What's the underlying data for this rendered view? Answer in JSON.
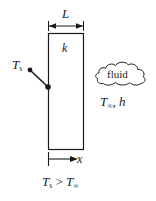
{
  "figure": {
    "ink_color": "#1a1a1a",
    "background_color": "#ffffff"
  },
  "wall": {
    "thickness_label": "L",
    "conductivity_label": "k",
    "surface_temp_symbol": "T",
    "surface_temp_subscript": "s"
  },
  "fluid": {
    "cloud_label": "fluid",
    "temp_symbol": "T",
    "temp_subscript": "∞",
    "separator": ", ",
    "coefficient_label": "h"
  },
  "axis": {
    "x_label": "x"
  },
  "condition": {
    "left_symbol": "T",
    "left_subscript": "s",
    "operator": " > ",
    "right_symbol": "T",
    "right_subscript": "∞"
  }
}
